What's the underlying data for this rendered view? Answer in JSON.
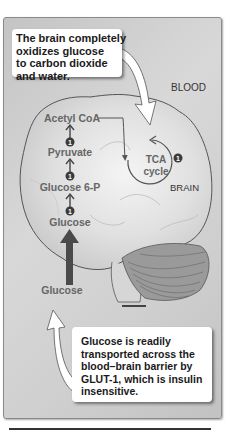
{
  "figure": {
    "top_callout": {
      "lines": [
        "The brain completely",
        "oxidizes glucose",
        "to carbon dioxide",
        "and water."
      ]
    },
    "bottom_callout": {
      "lines": [
        "Glucose is readily",
        "transported across the",
        "blood–brain barrier by",
        "GLUT-1, which is insulin",
        "insensitive."
      ]
    },
    "compartments": {
      "blood": "BLOOD",
      "brain": "BRAIN"
    },
    "pathway": {
      "acetyl_coa": "Acetyl CoA",
      "pyruvate": "Pyruvate",
      "glucose_6p": "Glucose 6-P",
      "glucose_brain": "Glucose",
      "glucose_blood": "Glucose",
      "tca_line1": "TCA",
      "tca_line2": "cycle",
      "step_marker": "1"
    },
    "icons": {
      "step_badge": "circled-number-icon",
      "flow_arrow": "up-arrow-icon",
      "callout_pointer": "curved-arrow-icon",
      "organ": "brain-illustration-icon"
    },
    "colors": {
      "panel_bg": "#d0d0d0",
      "text_gray": "#666666",
      "arrow_dark": "#4a4a4a",
      "callout_bg": "#ffffff",
      "cerebellum": "#9a9a9a"
    }
  }
}
